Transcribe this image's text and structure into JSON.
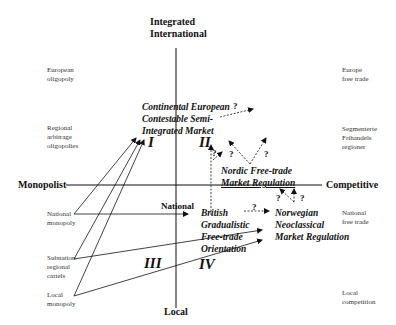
{
  "axes": {
    "top": [
      "Integrated",
      "International"
    ],
    "bottom": "Local",
    "left": "Monopolist",
    "right": "Competitive",
    "center": "National"
  },
  "left_labels": [
    [
      "European",
      "oligopoly"
    ],
    [
      "Regional",
      "arbitrage",
      "oligopolies"
    ],
    [
      "National",
      "monopoly"
    ],
    [
      "Subnation",
      "regional",
      "cartels"
    ],
    [
      "Local",
      "monopoly"
    ]
  ],
  "right_labels": [
    [
      "Europe",
      "free trade"
    ],
    [
      "Segmenterte",
      "Frihandels",
      "regioner"
    ],
    [
      "National",
      "free trade"
    ],
    [
      "Local",
      "competition"
    ]
  ],
  "quadrants": [
    "I",
    "II",
    "III",
    "IV"
  ],
  "regimes": {
    "continental": [
      "Continental European",
      "Contestable Semi-",
      "Integrated Market"
    ],
    "nordic": [
      "Nordic Free-trade",
      "Market Regulation"
    ],
    "british": [
      "British",
      "Gradualistic",
      "Free-trade",
      "Orientation"
    ],
    "norwegian": [
      "Norwegian",
      "Neoclassical",
      "Market Regulation"
    ]
  },
  "question_mark": "?"
}
